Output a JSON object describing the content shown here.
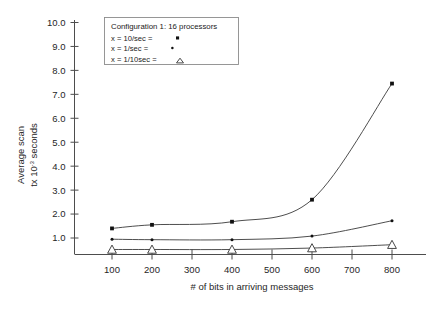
{
  "chart_data": {
    "type": "line",
    "title": "",
    "xlabel": "# of bits in arriving messages",
    "ylabel": "Average scan tx 10-3 seconds",
    "ylabel_line1": "Average scan",
    "ylabel_line2_prefix": "tx 10",
    "ylabel_line2_exponent": "-3",
    "ylabel_line2_suffix": " seconds",
    "x": [
      100,
      200,
      400,
      600,
      800
    ],
    "xticks": [
      100,
      200,
      300,
      400,
      500,
      600,
      700,
      800
    ],
    "xtick_labels": [
      "100",
      "200",
      "300",
      "400",
      "500",
      "600",
      "700",
      "800"
    ],
    "yticks": [
      1.0,
      2.0,
      3.0,
      4.0,
      5.0,
      6.0,
      7.0,
      8.0,
      9.0,
      10.0
    ],
    "ytick_labels": [
      "1.0",
      "2.0",
      "3.0",
      "4.0",
      "5.0",
      "6.0",
      "7.0",
      "8.0",
      "9.0",
      "10.0"
    ],
    "xlim": [
      70,
      830
    ],
    "ylim": [
      0.38,
      10.0
    ],
    "grid": false,
    "legend_position": "upper-left",
    "series": [
      {
        "name": "x = 10/sec",
        "marker": "square",
        "values": [
          1.4,
          1.55,
          1.68,
          2.6,
          7.45
        ]
      },
      {
        "name": "x = 1/sec",
        "marker": "dot",
        "values": [
          0.95,
          0.93,
          0.93,
          1.08,
          1.72
        ]
      },
      {
        "name": "x = 1/10sec",
        "marker": "triangle",
        "values": [
          0.52,
          0.52,
          0.52,
          0.58,
          0.72
        ]
      }
    ]
  },
  "legend": {
    "title": "Configuration 1: 16 processors",
    "entries": [
      {
        "label": "x = 10/sec =",
        "glyph": "square"
      },
      {
        "label": "x = 1/sec =",
        "glyph": "dot"
      },
      {
        "label": "x = 1/10sec =",
        "glyph": "triangle"
      }
    ]
  },
  "colors": {
    "line": "#3a3a3a",
    "axis": "#4d4d4d",
    "marker": "#111111",
    "background": "#ffffff"
  }
}
